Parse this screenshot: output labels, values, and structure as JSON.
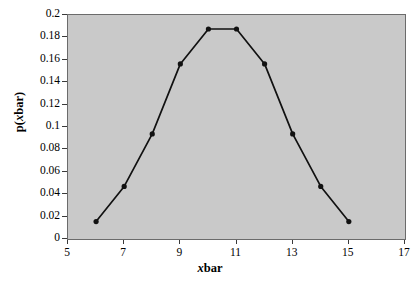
{
  "chart_data": {
    "type": "line",
    "title": "",
    "xlabel": "xbar",
    "ylabel": "p(xbar)",
    "xlabel_parts": {
      "italic": "x",
      "rest": "bar"
    },
    "ylabel_parts": {
      "prefix": "p(",
      "italic": "x",
      "rest": "bar)"
    },
    "x": [
      6,
      7,
      8,
      9,
      10,
      11,
      12,
      13,
      14,
      15
    ],
    "values": [
      0.0156,
      0.0469,
      0.0938,
      0.1563,
      0.1875,
      0.1875,
      0.1563,
      0.0938,
      0.0469,
      0.0156
    ],
    "series": [
      {
        "name": "p(xbar)",
        "values": [
          0.0156,
          0.0469,
          0.0938,
          0.1563,
          0.1875,
          0.1875,
          0.1563,
          0.0938,
          0.0469,
          0.0156
        ]
      }
    ],
    "xlim": [
      5,
      17
    ],
    "ylim": [
      0,
      0.2
    ],
    "xticks": [
      5,
      7,
      9,
      11,
      13,
      15,
      17
    ],
    "xtick_labels": [
      "5",
      "7",
      "9",
      "11",
      "13",
      "15",
      "17"
    ],
    "yticks": [
      0,
      0.02,
      0.04,
      0.06,
      0.08,
      0.1,
      0.12,
      0.14,
      0.16,
      0.18,
      0.2
    ],
    "ytick_labels": [
      "0",
      "0.02",
      "0.04",
      "0.06",
      "0.08",
      "0.1",
      "0.12",
      "0.14",
      "0.16",
      "0.18",
      "0.2"
    ],
    "grid": false,
    "legend": null,
    "marker": "filled-circle",
    "line_color": "#111111",
    "marker_color": "#111111",
    "plot_background": "#c9c9c9",
    "figure_background": "#ffffff",
    "axis_color": "#6b6b6b"
  }
}
